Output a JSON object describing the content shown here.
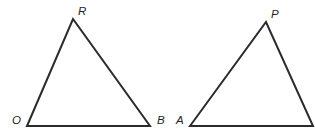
{
  "figure": {
    "kind": "geometry-diagram",
    "background_color": "#ffffff",
    "stroke_color": "#2b2b2b",
    "stroke_width": 2,
    "label_color": "#1f1f1f",
    "label_font_size": 11.5,
    "width": 315,
    "height": 137,
    "shapes": [
      {
        "name": "left-triangle",
        "points": "27,126 73,19 150,126",
        "vertices": [
          {
            "label": "O",
            "x": 27,
            "y": 126,
            "label_x": 12,
            "label_y": 124
          },
          {
            "label": "R",
            "x": 73,
            "y": 19,
            "label_x": 78,
            "label_y": 15
          },
          {
            "label": "B",
            "x": 150,
            "y": 126,
            "label_x": 157,
            "label_y": 124
          }
        ]
      },
      {
        "name": "right-triangle",
        "points": "190,126 266,22 313,126",
        "vertices": [
          {
            "label": "A",
            "x": 190,
            "y": 126,
            "label_x": 176,
            "label_y": 124
          },
          {
            "label": "P",
            "x": 266,
            "y": 22,
            "label_x": 271,
            "label_y": 18
          },
          {
            "label": "",
            "x": 313,
            "y": 126,
            "label_x": 0,
            "label_y": 0
          }
        ]
      }
    ]
  }
}
